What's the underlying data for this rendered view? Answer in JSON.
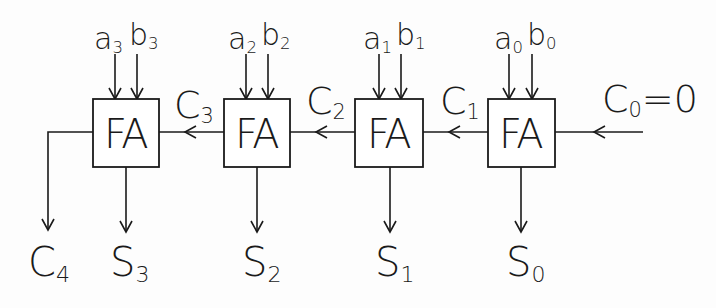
{
  "diagram": {
    "stroke_color": "#1a1a1a",
    "background": "#fdfdfd",
    "blocks": [
      {
        "id": "fa3",
        "label": "FA",
        "x": 93,
        "inputs": {
          "a": "a",
          "a_sub": "3",
          "b": "b",
          "b_sub": "3"
        },
        "sum": {
          "s": "S",
          "sub": "3"
        }
      },
      {
        "id": "fa2",
        "label": "FA",
        "x": 224,
        "inputs": {
          "a": "a",
          "a_sub": "2",
          "b": "b",
          "b_sub": "2"
        },
        "sum": {
          "s": "S",
          "sub": "2"
        }
      },
      {
        "id": "fa1",
        "label": "FA",
        "x": 355,
        "inputs": {
          "a": "a",
          "a_sub": "1",
          "b": "b",
          "b_sub": "1"
        },
        "sum": {
          "s": "S",
          "sub": "1"
        }
      },
      {
        "id": "fa0",
        "label": "FA",
        "x": 488,
        "inputs": {
          "a": "a",
          "a_sub": "0",
          "b": "b",
          "b_sub": "0"
        },
        "sum": {
          "s": "S",
          "sub": "0"
        }
      }
    ],
    "carries": [
      {
        "c": "C",
        "sub": "3"
      },
      {
        "c": "C",
        "sub": "2"
      },
      {
        "c": "C",
        "sub": "1"
      }
    ],
    "carry_in": {
      "c": "C",
      "sub": "0",
      "value": "=0"
    },
    "carry_out": {
      "c": "C",
      "sub": "4"
    }
  }
}
